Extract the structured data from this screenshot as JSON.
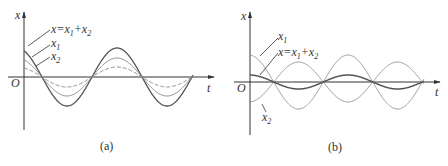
{
  "figure": {
    "panels": [
      {
        "id": "a",
        "caption": "(a)",
        "axis_x_label": "t",
        "axis_y_label": "x",
        "origin_label": "O",
        "labels": {
          "sum": "x=x",
          "sum_sub1": "1",
          "plus": "+x",
          "sum_sub2": "2",
          "x1": "x",
          "x1_sub": "1",
          "x2": "x",
          "x2_sub": "2"
        },
        "description": "In-phase oscillations: resultant amplitude equals sum of amplitudes"
      },
      {
        "id": "b",
        "caption": "(b)",
        "axis_x_label": "t",
        "axis_y_label": "x",
        "origin_label": "O",
        "labels": {
          "sum": "x=x",
          "sum_sub1": "1",
          "plus": "+x",
          "sum_sub2": "2",
          "x1": "x",
          "x1_sub": "1",
          "x2": "x",
          "x2_sub": "2"
        },
        "description": "Anti-phase oscillations: resultant amplitude equals difference of amplitudes"
      }
    ],
    "colors": {
      "axis": "#333333",
      "sum_curve": "#555555",
      "component_curve": "#888888",
      "dashed_curve": "#888888"
    }
  }
}
